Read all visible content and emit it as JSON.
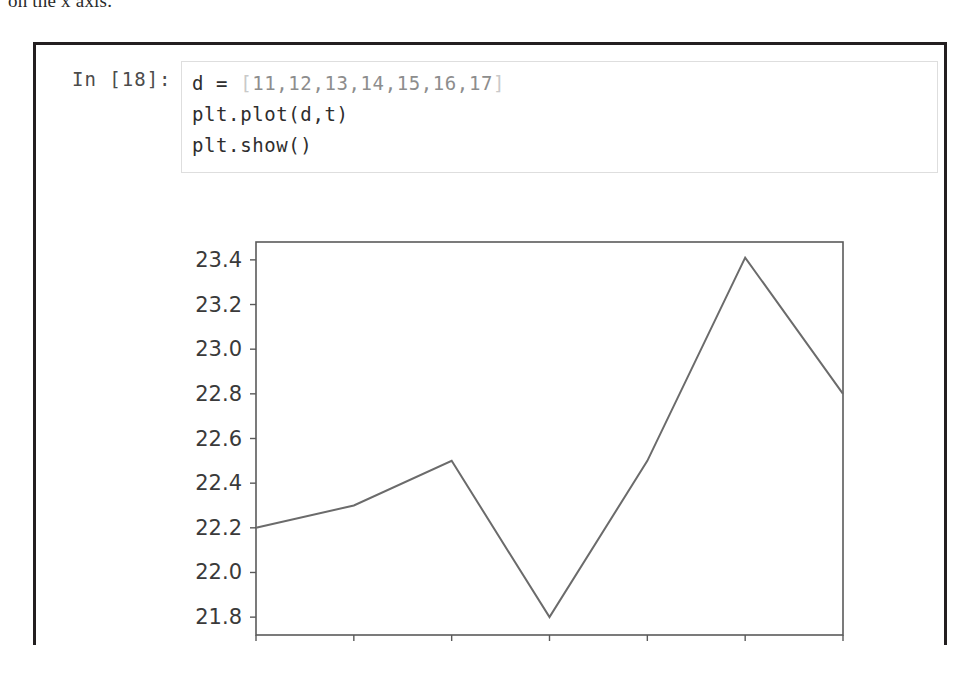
{
  "page": {
    "prose_fragment": "on the x axis."
  },
  "notebook_cell": {
    "prompt": "In [18]:",
    "code_lines": [
      {
        "prefix": "d = ",
        "open_bracket": "[",
        "list": "11,12,13,14,15,16,17",
        "close_bracket": "]"
      },
      {
        "text": "plt.plot(d,t)"
      },
      {
        "text": "plt.show()"
      }
    ]
  },
  "chart_data": {
    "type": "line",
    "title": "",
    "xlabel": "",
    "ylabel": "",
    "x": [
      11,
      12,
      13,
      14,
      15,
      16,
      17
    ],
    "values": [
      22.2,
      22.3,
      22.5,
      21.8,
      22.5,
      23.41,
      22.8
    ],
    "series": [
      {
        "name": "t",
        "values": [
          22.2,
          22.3,
          22.5,
          21.8,
          22.5,
          23.41,
          22.8
        ]
      }
    ],
    "xticks": [
      "11",
      "12",
      "13",
      "14",
      "15",
      "16",
      "17"
    ],
    "yticks": [
      "21.8",
      "22.0",
      "22.2",
      "22.4",
      "22.6",
      "22.8",
      "23.0",
      "23.2",
      "23.4"
    ],
    "xlim": [
      11,
      17
    ],
    "ylim": [
      21.72,
      23.48
    ],
    "grid": false,
    "legend": false,
    "line_color": "#6b6b6b",
    "axes_color": "#5a5a5a",
    "tick_label_color": "#3a3a3a"
  }
}
